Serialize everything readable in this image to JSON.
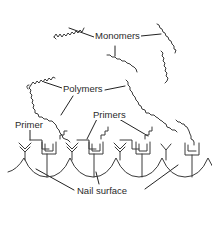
{
  "diagram": {
    "labels": {
      "monomers": "Monomers",
      "polymers": "Polymers",
      "primer": "Primer",
      "primers": "Primers",
      "nail_surface": "Nail surface"
    },
    "colors": {
      "line": "#3a3a3a",
      "text": "#2a2a2a",
      "background": "#ffffff"
    }
  }
}
